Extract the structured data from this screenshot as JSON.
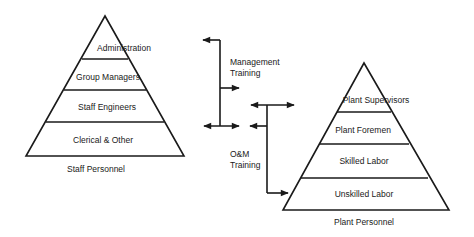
{
  "staff_pyramid": {
    "levels": [
      "Administration",
      "Group Managers",
      "Staff Engineers",
      "Clerical & Other"
    ],
    "caption": "Staff Personnel"
  },
  "plant_pyramid": {
    "levels": [
      "Plant Supervisors",
      "Plant Foremen",
      "Skilled Labor",
      "Unskilled Labor"
    ],
    "caption": "Plant Personnel"
  },
  "connectors": {
    "management": {
      "line1": "Management",
      "line2": "Training"
    },
    "om": {
      "line1": "O&M",
      "line2": "Training"
    }
  },
  "colors": {
    "ink": "#1a1a1a",
    "background": "#ffffff"
  }
}
